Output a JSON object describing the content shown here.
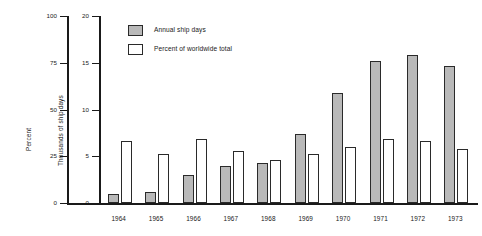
{
  "chart_data": {
    "type": "bar",
    "title": "",
    "subtitle": "",
    "xlabel": "",
    "categories": [
      "1964",
      "1965",
      "1966",
      "1967",
      "1968",
      "1969",
      "1970",
      "1971",
      "1972",
      "1973"
    ],
    "grid": false,
    "legend_position": "top-left",
    "axes": {
      "left": {
        "label": "Percent",
        "ticks": [
          "0",
          "25",
          "50",
          "75",
          "100"
        ],
        "tick_values": [
          0,
          25,
          50,
          75,
          100
        ],
        "range": [
          0,
          100
        ]
      },
      "right_inner": {
        "label": "Thousands of ship days",
        "ticks": [
          "0",
          "5",
          "10",
          "15",
          "20"
        ],
        "tick_values": [
          0,
          5,
          10,
          15,
          20
        ],
        "range": [
          0,
          20
        ]
      }
    },
    "series": [
      {
        "name": "Annual ship days",
        "axis": "Thousands of ship days",
        "unit": "thousands of ship days",
        "fill": "stippled-gray",
        "values": [
          1.0,
          1.2,
          3.0,
          4.0,
          4.3,
          7.4,
          11.8,
          15.2,
          15.8,
          14.6
        ]
      },
      {
        "name": "Percent of worldwide total",
        "axis": "Percent",
        "unit": "percent",
        "fill": "white",
        "values": [
          33,
          26,
          34,
          28,
          23,
          26,
          30,
          34,
          33,
          29
        ]
      }
    ]
  },
  "legend": {
    "items": [
      {
        "label": "Annual ship days",
        "swatch": "stippled-gray"
      },
      {
        "label": "Percent of worldwide total",
        "swatch": "white"
      }
    ]
  }
}
